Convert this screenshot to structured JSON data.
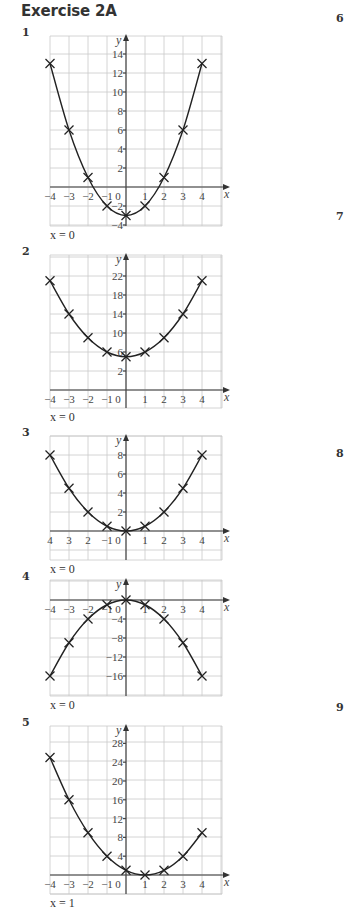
{
  "heading": "Exercise 2A",
  "side_numbers": [
    {
      "label": "6",
      "top": 12
    },
    {
      "label": "7",
      "top": 210
    },
    {
      "label": "8",
      "top": 447
    },
    {
      "label": "9",
      "top": 701
    }
  ],
  "chart_data": [
    {
      "number": "1",
      "type": "scatter",
      "title": "",
      "xlabel": "x",
      "ylabel": "y",
      "x": [
        -4,
        -3,
        -2,
        -1,
        0,
        1,
        2,
        3,
        4
      ],
      "values": [
        13,
        6,
        1,
        -2,
        -3,
        -2,
        1,
        6,
        13
      ],
      "x_tick_labels": [
        "-4",
        "-3",
        "-2",
        "-1",
        "0",
        "1",
        "2",
        "3",
        "4"
      ],
      "y_tick_labels": [
        "14",
        "12",
        "10",
        "8",
        "6",
        "4",
        "2",
        "-2",
        "-4"
      ],
      "y_ticks": [
        14,
        12,
        10,
        8,
        6,
        4,
        2,
        -2,
        -4
      ],
      "xlim": [
        -4,
        4.5
      ],
      "ylim": [
        -4,
        15.5
      ],
      "grid": true,
      "curve": "smooth",
      "marker": "x",
      "answer": "x = 0",
      "layout": {
        "top": 36,
        "bottom": 226,
        "x0_px": 126,
        "xaxis_px": 187,
        "px_per_x": 19,
        "px_per_y": 9.5
      }
    },
    {
      "number": "2",
      "type": "scatter",
      "title": "",
      "xlabel": "x",
      "ylabel": "y",
      "x": [
        -4,
        -3,
        -2,
        -1,
        0,
        1,
        2,
        3,
        4
      ],
      "values": [
        21,
        14,
        9,
        6,
        5,
        6,
        9,
        14,
        21
      ],
      "x_tick_labels": [
        "-4",
        "-3",
        "-2",
        "-1",
        "0",
        "1",
        "2",
        "3",
        "4"
      ],
      "y_tick_labels": [
        "22",
        "18",
        "14",
        "10",
        "6",
        "2"
      ],
      "y_ticks": [
        22,
        18,
        14,
        10,
        6,
        2
      ],
      "xlim": [
        -4,
        4.5
      ],
      "ylim": [
        0,
        24
      ],
      "grid": true,
      "curve": "smooth",
      "marker": "x",
      "answer": "x = 0",
      "layout": {
        "top": 255,
        "bottom": 408,
        "x0_px": 126,
        "xaxis_px": 390,
        "y_ref": {
          "value": 2,
          "px": 371
        },
        "px_per_x": 19,
        "px_per_y": 4.75
      }
    },
    {
      "number": "3",
      "type": "scatter",
      "title": "",
      "xlabel": "x",
      "ylabel": "y",
      "x": [
        -4,
        -3,
        -2,
        -1,
        0,
        1,
        2,
        3,
        4
      ],
      "values": [
        8,
        4.5,
        2,
        0.5,
        0,
        0.5,
        2,
        4.5,
        8
      ],
      "x_tick_labels": [
        "4",
        "3",
        "2",
        "-1",
        "0",
        "1",
        "2",
        "3",
        "4"
      ],
      "y_tick_labels": [
        "8",
        "6",
        "4",
        "2"
      ],
      "y_ticks": [
        8,
        6,
        4,
        2
      ],
      "xlim": [
        -4,
        4.5
      ],
      "ylim": [
        -1,
        9
      ],
      "grid": true,
      "curve": "smooth",
      "marker": "x",
      "answer": "x = 0",
      "layout": {
        "top": 436,
        "bottom": 560,
        "x0_px": 126,
        "xaxis_px": 531,
        "px_per_x": 19,
        "px_per_y": 9.5
      }
    },
    {
      "number": "4",
      "type": "scatter",
      "title": "",
      "xlabel": "x",
      "ylabel": "y",
      "x": [
        -4,
        -3,
        -2,
        -1,
        0,
        1,
        2,
        3,
        4
      ],
      "values": [
        -16,
        -9,
        -4,
        -1,
        0,
        -1,
        -4,
        -9,
        -16
      ],
      "x_tick_labels": [
        "-4",
        "-3",
        "-2",
        "-1",
        "0",
        "1",
        "2",
        "3",
        "4"
      ],
      "y_tick_labels": [
        "-4",
        "-8",
        "-12",
        "-16"
      ],
      "y_ticks": [
        -4,
        -8,
        -12,
        -16
      ],
      "xlim": [
        -4,
        4.5
      ],
      "ylim": [
        -18,
        4
      ],
      "grid": true,
      "curve": "smooth",
      "marker": "x",
      "answer": "x = 0",
      "layout": {
        "top": 580,
        "bottom": 696,
        "x0_px": 126,
        "xaxis_px": 600,
        "px_per_x": 19,
        "px_per_y": 4.75
      }
    },
    {
      "number": "5",
      "type": "scatter",
      "title": "",
      "xlabel": "x",
      "ylabel": "y",
      "x": [
        -4,
        -3,
        -2,
        -1,
        0,
        1,
        2,
        3,
        4
      ],
      "values": [
        25,
        16,
        9,
        4,
        1,
        0,
        1,
        4,
        9
      ],
      "x_tick_labels": [
        "-4",
        "-3",
        "-2",
        "-1",
        "0",
        "1",
        "2",
        "3",
        "4"
      ],
      "y_tick_labels": [
        "28",
        "24",
        "20",
        "16",
        "12",
        "8",
        "4"
      ],
      "y_ticks": [
        28,
        24,
        20,
        16,
        12,
        8,
        4
      ],
      "xlim": [
        -4,
        4.5
      ],
      "ylim": [
        -3,
        30
      ],
      "grid": true,
      "curve": "smooth",
      "marker": "x",
      "answer": "x = 1",
      "layout": {
        "top": 726,
        "bottom": 894,
        "x0_px": 126,
        "xaxis_px": 875,
        "px_per_x": 19,
        "px_per_y": 4.7
      }
    }
  ]
}
